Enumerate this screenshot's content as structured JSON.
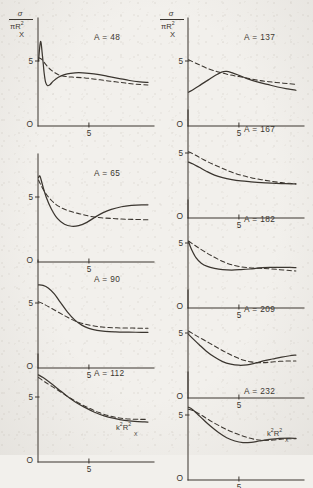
{
  "figure": {
    "background_hex": "#f2f0ec",
    "ink_hex": "#3a352f",
    "y_axis_label": {
      "numerator": "σ",
      "denominator_pi": "πR",
      "denominator_sup": "2",
      "denominator_sub": "X"
    },
    "x_axis_label": {
      "base": "k",
      "sup1": "2",
      "base2": "R",
      "sup2": "2",
      "sub2": "X"
    },
    "origin_label": "O",
    "y_tick_label": "5",
    "x_tick_label": "5"
  },
  "chart_data": {
    "type": "line",
    "title": "",
    "xlabel": "k²R²X",
    "ylabel": "σ/πR²X",
    "xlim": [
      0,
      11
    ],
    "ylim": [
      0,
      8
    ],
    "x_ticks": [
      5
    ],
    "y_ticks": [
      5
    ],
    "grid": false,
    "legend": [
      "solid",
      "dashed"
    ],
    "legend_position": "none",
    "panels": [
      {
        "label": "A = 48",
        "column": "left",
        "solid": {
          "name": "solid",
          "x": [
            0.05,
            0.25,
            0.45,
            0.6,
            0.75,
            0.95,
            1.2,
            1.5,
            2.0,
            2.6,
            3.2,
            4.0,
            5.0,
            6.0,
            7.0,
            8.0,
            9.0,
            10.0,
            10.8
          ],
          "y": [
            5.0,
            6.5,
            5.3,
            4.1,
            3.35,
            3.1,
            3.2,
            3.45,
            3.75,
            3.95,
            4.05,
            4.1,
            4.05,
            3.95,
            3.8,
            3.65,
            3.5,
            3.4,
            3.35
          ]
        },
        "dashed": {
          "name": "dashed",
          "x": [
            0.05,
            0.4,
            0.8,
            1.3,
            2.0,
            2.8,
            3.6,
            4.6,
            5.6,
            6.6,
            7.6,
            8.6,
            9.6,
            10.8
          ],
          "y": [
            5.25,
            5.1,
            4.7,
            4.3,
            3.95,
            3.8,
            3.75,
            3.7,
            3.6,
            3.5,
            3.4,
            3.3,
            3.22,
            3.15
          ]
        }
      },
      {
        "label": "A = 65",
        "column": "left",
        "solid": {
          "name": "solid",
          "x": [
            0.05,
            0.2,
            0.45,
            0.8,
            1.3,
            1.9,
            2.6,
            3.3,
            4.0,
            4.8,
            5.6,
            6.4,
            7.2,
            8.2,
            9.2,
            10.2,
            10.8
          ],
          "y": [
            6.5,
            6.6,
            5.9,
            5.0,
            4.1,
            3.35,
            2.9,
            2.75,
            2.8,
            3.05,
            3.45,
            3.8,
            4.05,
            4.25,
            4.35,
            4.4,
            4.4
          ]
        },
        "dashed": {
          "name": "dashed",
          "x": [
            0.05,
            0.3,
            0.7,
            1.3,
            2.0,
            2.8,
            3.6,
            4.4,
            5.2,
            6.2,
            7.2,
            8.2,
            9.2,
            10.2,
            10.8
          ],
          "y": [
            6.3,
            5.9,
            5.35,
            4.75,
            4.3,
            4.0,
            3.8,
            3.65,
            3.5,
            3.4,
            3.35,
            3.3,
            3.28,
            3.26,
            3.25
          ]
        }
      },
      {
        "label": "A = 90",
        "column": "left",
        "solid": {
          "name": "solid",
          "x": [
            0.05,
            0.5,
            1.0,
            1.6,
            2.2,
            2.9,
            3.6,
            4.3,
            5.0,
            5.8,
            6.6,
            7.6,
            8.6,
            9.6,
            10.8
          ],
          "y": [
            6.4,
            6.35,
            6.15,
            5.7,
            5.05,
            4.3,
            3.7,
            3.3,
            3.05,
            2.9,
            2.82,
            2.78,
            2.76,
            2.75,
            2.75
          ]
        },
        "dashed": {
          "name": "dashed",
          "x": [
            0.05,
            0.6,
            1.3,
            2.1,
            2.9,
            3.7,
            4.5,
            5.4,
            6.3,
            7.3,
            8.3,
            9.3,
            10.3,
            10.8
          ],
          "y": [
            5.1,
            4.9,
            4.6,
            4.25,
            3.9,
            3.6,
            3.4,
            3.25,
            3.15,
            3.1,
            3.08,
            3.07,
            3.06,
            3.05
          ]
        }
      },
      {
        "label": "A = 112",
        "column": "left",
        "solid": {
          "name": "solid",
          "x": [
            0.05,
            0.5,
            1.2,
            2.0,
            2.8,
            3.7,
            4.6,
            5.5,
            6.5,
            7.5,
            8.5,
            9.5,
            10.5,
            10.8
          ],
          "y": [
            6.7,
            6.5,
            6.1,
            5.6,
            5.1,
            4.6,
            4.2,
            3.85,
            3.55,
            3.35,
            3.2,
            3.12,
            3.08,
            3.07
          ]
        },
        "dashed": {
          "name": "dashed",
          "x": [
            0.05,
            0.6,
            1.4,
            2.3,
            3.2,
            4.1,
            5.0,
            6.0,
            7.0,
            8.0,
            9.0,
            10.0,
            10.8
          ],
          "y": [
            6.5,
            6.2,
            5.8,
            5.35,
            4.9,
            4.5,
            4.15,
            3.8,
            3.55,
            3.38,
            3.3,
            3.28,
            3.28
          ]
        }
      },
      {
        "label": "A = 137",
        "column": "right",
        "solid": {
          "name": "solid",
          "x": [
            0.05,
            0.6,
            1.3,
            2.0,
            2.7,
            3.3,
            3.8,
            4.3,
            5.0,
            5.8,
            6.8,
            7.8,
            8.8,
            9.8,
            10.6
          ],
          "y": [
            2.6,
            2.85,
            3.2,
            3.55,
            3.9,
            4.15,
            4.2,
            4.1,
            3.9,
            3.65,
            3.4,
            3.2,
            3.0,
            2.85,
            2.75
          ]
        },
        "dashed": {
          "name": "dashed",
          "x": [
            0.05,
            1.0,
            2.0,
            3.0,
            4.0,
            5.0,
            6.0,
            7.0,
            8.0,
            9.0,
            10.0,
            10.6
          ],
          "y": [
            5.1,
            4.75,
            4.4,
            4.15,
            3.95,
            3.8,
            3.65,
            3.5,
            3.4,
            3.32,
            3.25,
            3.2
          ]
        }
      },
      {
        "label": "A = 167",
        "column": "right",
        "solid": {
          "name": "solid",
          "x": [
            0.05,
            0.5,
            1.1,
            1.8,
            2.6,
            3.4,
            4.3,
            5.2,
            6.2,
            7.2,
            8.2,
            9.2,
            10.2,
            10.6
          ],
          "y": [
            4.3,
            4.15,
            3.9,
            3.6,
            3.3,
            3.1,
            2.95,
            2.85,
            2.78,
            2.72,
            2.68,
            2.65,
            2.63,
            2.62
          ]
        },
        "dashed": {
          "name": "dashed",
          "x": [
            0.05,
            0.7,
            1.5,
            2.4,
            3.3,
            4.2,
            5.2,
            6.2,
            7.2,
            8.2,
            9.2,
            10.2,
            10.6
          ],
          "y": [
            5.1,
            4.85,
            4.5,
            4.15,
            3.85,
            3.55,
            3.3,
            3.1,
            2.95,
            2.82,
            2.72,
            2.65,
            2.62
          ]
        }
      },
      {
        "label": "A = 182",
        "column": "right",
        "solid": {
          "name": "solid",
          "x": [
            0.05,
            0.35,
            0.8,
            1.3,
            1.9,
            2.6,
            3.4,
            4.3,
            5.2,
            6.1,
            7.0,
            8.0,
            9.0,
            10.0,
            10.6
          ],
          "y": [
            5.1,
            4.5,
            3.85,
            3.45,
            3.2,
            3.05,
            2.95,
            2.92,
            2.95,
            3.0,
            3.08,
            3.12,
            3.13,
            3.12,
            3.1
          ]
        },
        "dashed": {
          "name": "dashed",
          "x": [
            0.05,
            0.8,
            1.7,
            2.6,
            3.5,
            4.4,
            5.3,
            6.2,
            7.1,
            8.0,
            9.0,
            10.0,
            10.6
          ],
          "y": [
            5.15,
            4.75,
            4.3,
            3.9,
            3.55,
            3.3,
            3.15,
            3.08,
            3.05,
            3.02,
            2.95,
            2.88,
            2.85
          ]
        }
      },
      {
        "label": "A = 209",
        "column": "right",
        "solid": {
          "name": "solid",
          "x": [
            0.05,
            0.5,
            1.1,
            1.8,
            2.6,
            3.4,
            4.2,
            5.0,
            5.8,
            6.6,
            7.4,
            8.3,
            9.2,
            10.0,
            10.6
          ],
          "y": [
            4.9,
            4.55,
            4.1,
            3.6,
            3.15,
            2.8,
            2.6,
            2.52,
            2.55,
            2.68,
            2.85,
            3.0,
            3.15,
            3.25,
            3.3
          ]
        },
        "dashed": {
          "name": "dashed",
          "x": [
            0.05,
            0.8,
            1.7,
            2.6,
            3.5,
            4.4,
            5.3,
            6.2,
            7.1,
            8.0,
            9.0,
            10.0,
            10.6
          ],
          "y": [
            5.15,
            4.8,
            4.4,
            4.0,
            3.6,
            3.25,
            2.95,
            2.78,
            2.72,
            2.75,
            2.82,
            2.85,
            2.85
          ]
        }
      },
      {
        "label": "A = 232",
        "column": "right",
        "solid": {
          "name": "solid",
          "x": [
            0.05,
            0.4,
            0.9,
            1.5,
            2.2,
            3.0,
            3.8,
            4.6,
            5.4,
            6.2,
            7.0,
            8.0,
            9.0,
            10.0,
            10.6
          ],
          "y": [
            5.6,
            5.45,
            5.1,
            4.65,
            4.15,
            3.65,
            3.25,
            3.0,
            2.88,
            2.9,
            3.0,
            3.12,
            3.2,
            3.22,
            3.2
          ]
        },
        "dashed": {
          "name": "dashed",
          "x": [
            0.05,
            0.6,
            1.3,
            2.1,
            3.0,
            3.9,
            4.8,
            5.7,
            6.6,
            7.5,
            8.4,
            9.3,
            10.2,
            10.6
          ],
          "y": [
            5.45,
            5.3,
            5.0,
            4.6,
            4.2,
            3.85,
            3.55,
            3.3,
            3.12,
            3.05,
            3.08,
            3.15,
            3.18,
            3.18
          ]
        }
      }
    ]
  }
}
